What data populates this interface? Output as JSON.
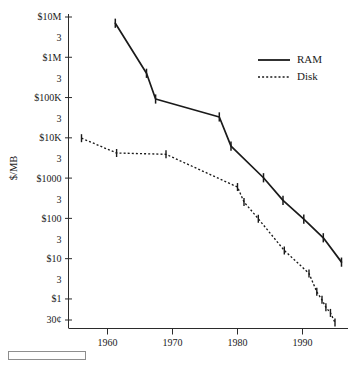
{
  "chart_data": {
    "type": "line",
    "title": "",
    "subtitle": "",
    "xlabel": "",
    "ylabel": "$/MB",
    "xlim": [
      1954,
      1997
    ],
    "ylim_log10": [
      -0.6,
      7.0
    ],
    "yscale": "log",
    "grid": false,
    "legend_position": "top-right",
    "x_ticks": [
      1960,
      1970,
      1980,
      1990
    ],
    "x_tick_labels": [
      "1960",
      "1970",
      "1980",
      "1990"
    ],
    "y_ticks_value": [
      10000000,
      3000000,
      1000000,
      300000,
      100000,
      30000,
      10000,
      3000,
      1000,
      300,
      100,
      30,
      10,
      3,
      1,
      0.3
    ],
    "y_tick_labels": [
      "$10M",
      "3",
      "$1M",
      "3",
      "$100K",
      "3",
      "$10K",
      "3",
      "$1000",
      "3",
      "$100",
      "3",
      "$10",
      "3",
      "$1",
      "30¢"
    ],
    "series": [
      {
        "name": "RAM",
        "style": "solid",
        "color": "#1a1a1a",
        "points": [
          {
            "x": 1961.2,
            "y": 7000000
          },
          {
            "x": 1966.0,
            "y": 400000
          },
          {
            "x": 1967.4,
            "y": 92000
          },
          {
            "x": 1977.2,
            "y": 33000
          },
          {
            "x": 1979.0,
            "y": 6200
          },
          {
            "x": 1984.0,
            "y": 1020
          },
          {
            "x": 1987.0,
            "y": 280
          },
          {
            "x": 1990.2,
            "y": 96
          },
          {
            "x": 1993.2,
            "y": 33
          },
          {
            "x": 1996.0,
            "y": 8.2
          }
        ]
      },
      {
        "name": "Disk",
        "style": "dotted",
        "color": "#1a1a1a",
        "points": [
          {
            "x": 1956.0,
            "y": 9800
          },
          {
            "x": 1961.4,
            "y": 4200
          },
          {
            "x": 1969.0,
            "y": 3900
          },
          {
            "x": 1980.0,
            "y": 600
          },
          {
            "x": 1981.0,
            "y": 255
          },
          {
            "x": 1983.2,
            "y": 98
          },
          {
            "x": 1987.2,
            "y": 16
          },
          {
            "x": 1991.0,
            "y": 4.3
          },
          {
            "x": 1992.2,
            "y": 1.5
          },
          {
            "x": 1993.0,
            "y": 0.95
          },
          {
            "x": 1993.6,
            "y": 0.62
          },
          {
            "x": 1994.3,
            "y": 0.45
          },
          {
            "x": 1995.0,
            "y": 0.26
          }
        ]
      }
    ],
    "legend": [
      {
        "label": "RAM",
        "style": "solid"
      },
      {
        "label": "Disk",
        "style": "dotted"
      }
    ]
  }
}
